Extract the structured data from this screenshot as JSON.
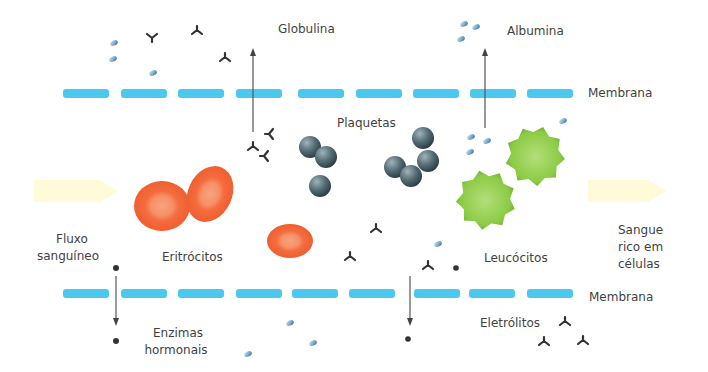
{
  "colors": {
    "membrane": "#4cc8ee",
    "erythrocyte": "#f4683a",
    "erythrocyte_center": "#f79a6e",
    "platelet": "#4f6770",
    "leukocyte": "#8fcb3f",
    "flow_arrow": "#fffbd8",
    "antibody": "#333333",
    "albumin": "#6fa4c8",
    "electrolyte": "#333333",
    "text": "#3f3f3f"
  },
  "labels": {
    "globulina": "Globulina",
    "albumina": "Albumina",
    "membrana_top": "Membrana",
    "membrana_bottom": "Membrana",
    "plaquetas": "Plaquetas",
    "fluxo_line1": "Fluxo",
    "fluxo_line2": "sanguíneo",
    "eritrocitos": "Eritrócitos",
    "leucocitos": "Leucócitos",
    "sangue_line1": "Sangue",
    "sangue_line2": "rico em",
    "sangue_line3": "células",
    "enzimas_line1": "Enzimas",
    "enzimas_line2": "hormonais",
    "eletrolitos": "Eletrólitos"
  },
  "icons": {
    "antibody": "y-shaped-antibody-icon",
    "albumin": "small-blue-pill-icon",
    "electrolyte": "small-black-dot-icon",
    "platelet": "grey-sphere-icon",
    "erythrocyte": "red-blood-cell-icon",
    "leukocyte": "green-spiky-cell-icon",
    "flow": "flow-arrow-icon"
  }
}
